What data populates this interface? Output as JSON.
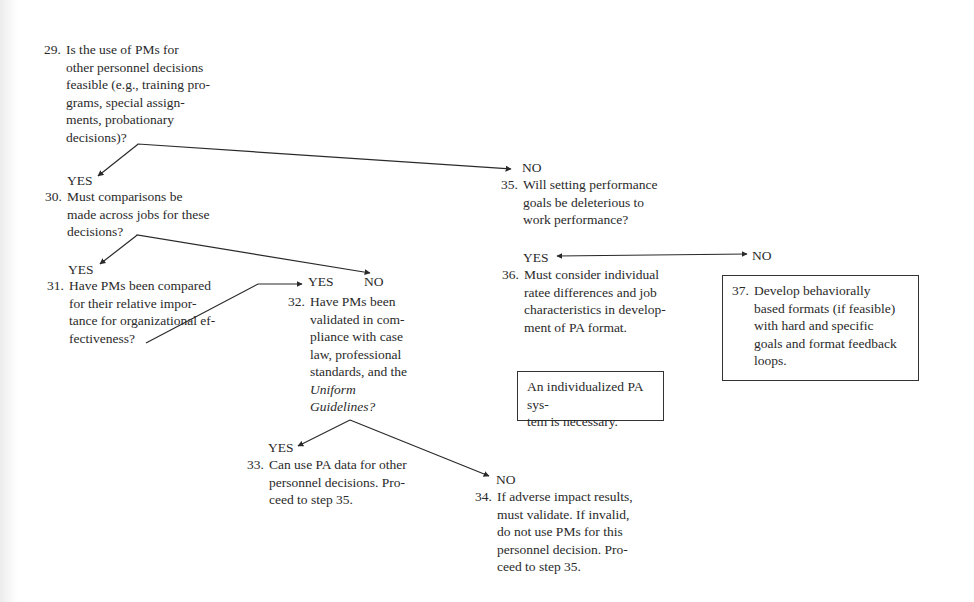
{
  "diagram": {
    "type": "decision-flowchart",
    "nodes": {
      "n29": {
        "number": "29.",
        "text": "Is the use of PMs for\nother personnel decisions\nfeasible (e.g., training pro-\ngrams, special assign-\nments, probationary\ndecisions)?"
      },
      "n30": {
        "number": "30.",
        "text": "Must comparisons be\nmade across jobs for these\ndecisions?"
      },
      "n31": {
        "number": "31.",
        "text": "Have PMs been compared\nfor their relative impor-\ntance for organizational ef-\nfectiveness?"
      },
      "n32": {
        "number": "32.",
        "text": "Have PMs been\nvalidated in com-\npliance with case\nlaw, professional\nstandards, and the",
        "italic_text": "Uniform\nGuidelines?"
      },
      "n33": {
        "number": "33.",
        "text": "Can use PA data for other\npersonnel decisions. Pro-\nceed to step 35."
      },
      "n34": {
        "number": "34.",
        "text": "If adverse impact results,\nmust validate. If invalid,\ndo not use PMs for this\npersonnel decision. Pro-\nceed to step 35."
      },
      "n35": {
        "number": "35.",
        "text": "Will setting performance\ngoals be deleterious to\nwork performance?"
      },
      "n36": {
        "number": "36.",
        "text": "Must consider individual\nratee differences and job\ncharacteristics in develop-\nment of PA format."
      },
      "n37": {
        "number": "37.",
        "text": "Develop behaviorally\nbased formats (if feasible)\nwith hard and specific\ngoals and format feedback\nloops."
      },
      "note": {
        "text": "An individualized PA sys-\ntem is necessary."
      }
    },
    "labels": {
      "yes29": "YES",
      "no29": "NO",
      "yes30": "YES",
      "no30": "NO",
      "yes31": "YES",
      "yes32": "YES",
      "no32": "NO",
      "yes35": "YES",
      "no35": "NO"
    },
    "edges": [
      {
        "from": "29",
        "to": "30",
        "label": "YES"
      },
      {
        "from": "29",
        "to": "35",
        "label": "NO"
      },
      {
        "from": "30",
        "to": "31",
        "label": "YES"
      },
      {
        "from": "30",
        "to": "32",
        "label": "NO"
      },
      {
        "from": "31",
        "to": "32",
        "label": "YES"
      },
      {
        "from": "32",
        "to": "33",
        "label": "YES"
      },
      {
        "from": "32",
        "to": "34",
        "label": "NO"
      },
      {
        "from": "35",
        "to": "36",
        "label": "YES"
      },
      {
        "from": "35",
        "to": "37",
        "label": "NO"
      }
    ],
    "colors": {
      "ink": "#2a2a2a",
      "background": "#ffffff",
      "box_border": "#333333"
    }
  }
}
